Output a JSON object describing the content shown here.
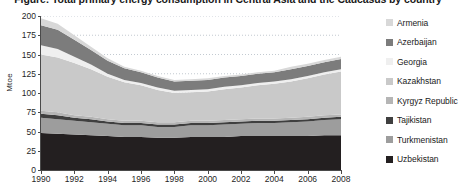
{
  "chart_data": {
    "type": "area",
    "stacked": true,
    "title": "Figure: Total primary energy consumption in Central Asia and the Caucasus by country",
    "xlabel": "",
    "ylabel": "Mtoe",
    "xlim": [
      1990,
      2008
    ],
    "ylim": [
      0,
      200
    ],
    "ytick_step": 25,
    "xtick_step": 2,
    "grid": true,
    "grid_style": "dotted-horizontal",
    "legend_position": "right",
    "x": [
      1990,
      1991,
      1992,
      1993,
      1994,
      1995,
      1996,
      1997,
      1998,
      1999,
      2000,
      2001,
      2002,
      2003,
      2004,
      2005,
      2006,
      2007,
      2008
    ],
    "xtick_labels": [
      "1990",
      "1992",
      "1994",
      "1996",
      "1998",
      "2000",
      "2002",
      "2004",
      "2006",
      "2008"
    ],
    "ytick_labels": [
      "0",
      "25",
      "50",
      "75",
      "100",
      "125",
      "150",
      "175",
      "200"
    ],
    "series": [
      {
        "name": "Uzbekistan",
        "color": "#231f20",
        "values": [
          48,
          47,
          46,
          45,
          44,
          43,
          43,
          42,
          42,
          43,
          43,
          43,
          44,
          44,
          44,
          44,
          44,
          45,
          45
        ]
      },
      {
        "name": "Turkmenistan",
        "color": "#9d9d9d",
        "values": [
          20,
          19,
          18,
          17,
          16,
          15,
          15,
          14,
          14,
          15,
          15,
          16,
          16,
          17,
          17,
          18,
          19,
          20,
          21
        ]
      },
      {
        "name": "Tajikistan",
        "color": "#3f3f3f",
        "values": [
          5,
          5,
          4,
          4,
          3,
          3,
          3,
          3,
          3,
          3,
          3,
          3,
          3,
          3,
          3,
          3,
          3,
          3,
          3
        ]
      },
      {
        "name": "Kyrgyz Republic",
        "color": "#b5b5b5",
        "values": [
          4,
          4,
          3,
          3,
          3,
          3,
          3,
          3,
          3,
          3,
          3,
          3,
          3,
          3,
          3,
          3,
          3,
          3,
          3
        ]
      },
      {
        "name": "Kazakhstan",
        "color": "#c9c9c9",
        "values": [
          73,
          71,
          68,
          62,
          55,
          50,
          46,
          42,
          38,
          37,
          38,
          40,
          41,
          43,
          45,
          47,
          50,
          53,
          56
        ]
      },
      {
        "name": "Georgia",
        "color": "#efefef",
        "values": [
          12,
          11,
          8,
          6,
          4,
          3,
          3,
          3,
          3,
          3,
          3,
          3,
          3,
          3,
          3,
          3,
          3,
          3,
          3
        ]
      },
      {
        "name": "Azerbaijan",
        "color": "#7c7c7c",
        "values": [
          26,
          25,
          22,
          19,
          17,
          15,
          14,
          13,
          12,
          12,
          12,
          12,
          12,
          12,
          12,
          13,
          13,
          13,
          13
        ]
      },
      {
        "name": "Armenia",
        "color": "#d8d8d8",
        "values": [
          9,
          8,
          6,
          4,
          3,
          2,
          2,
          2,
          2,
          2,
          2,
          2,
          2,
          2,
          2,
          3,
          3,
          3,
          3
        ]
      }
    ],
    "totals": [
      197,
      190,
      175,
      160,
      145,
      134,
      129,
      122,
      117,
      118,
      119,
      122,
      124,
      127,
      129,
      134,
      138,
      143,
      147
    ]
  },
  "axes": {
    "y_title": "Mtoe",
    "y_ticks": [
      {
        "label": "200",
        "value": 200
      },
      {
        "label": "175",
        "value": 175
      },
      {
        "label": "150",
        "value": 150
      },
      {
        "label": "125",
        "value": 125
      },
      {
        "label": "100",
        "value": 100
      },
      {
        "label": "75",
        "value": 75
      },
      {
        "label": "50",
        "value": 50
      },
      {
        "label": "25",
        "value": 25
      },
      {
        "label": "0",
        "value": 0
      }
    ],
    "x_ticks": [
      {
        "label": "1990",
        "value": 1990
      },
      {
        "label": "1992",
        "value": 1992
      },
      {
        "label": "1994",
        "value": 1994
      },
      {
        "label": "1996",
        "value": 1996
      },
      {
        "label": "1998",
        "value": 1998
      },
      {
        "label": "2000",
        "value": 2000
      },
      {
        "label": "2002",
        "value": 2002
      },
      {
        "label": "2004",
        "value": 2004
      },
      {
        "label": "2006",
        "value": 2006
      },
      {
        "label": "2008",
        "value": 2008
      }
    ]
  },
  "legend": {
    "items": [
      {
        "label": "Armenia",
        "color": "#d8d8d8"
      },
      {
        "label": "Azerbaijan",
        "color": "#7c7c7c"
      },
      {
        "label": "Georgia",
        "color": "#efefef"
      },
      {
        "label": "Kazakhstan",
        "color": "#c9c9c9"
      },
      {
        "label": "Kyrgyz Republic",
        "color": "#b5b5b5"
      },
      {
        "label": "Tajikistan",
        "color": "#3f3f3f"
      },
      {
        "label": "Turkmenistan",
        "color": "#9d9d9d"
      },
      {
        "label": "Uzbekistan",
        "color": "#231f20"
      }
    ]
  },
  "title": {
    "text": "Figure: Total primary energy consumption in Central Asia and the Caucasus by country"
  }
}
